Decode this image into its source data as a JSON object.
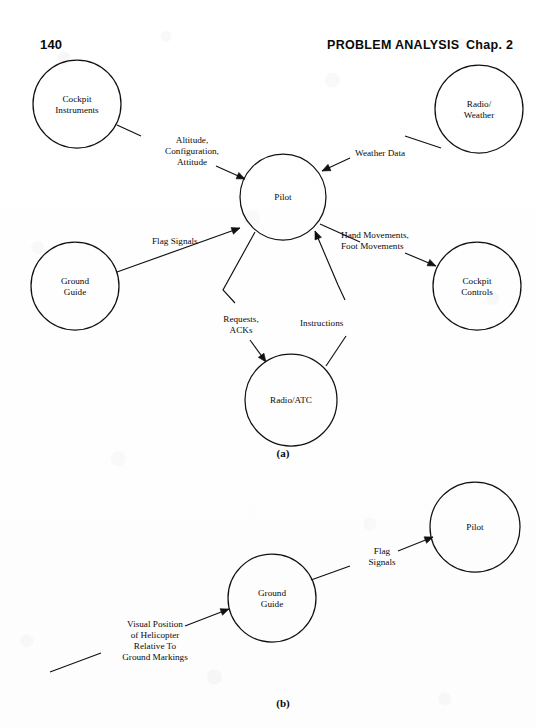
{
  "header": {
    "page_number": "140",
    "running_head": "PROBLEM ANALYSIS",
    "chapter_label": "Chap. 2"
  },
  "figures": [
    {
      "caption": "(a)",
      "x": 283,
      "y": 457
    },
    {
      "caption": "(b)",
      "x": 283,
      "y": 707
    }
  ],
  "diagram_a": {
    "nodes": [
      {
        "id": "cockpit-instruments",
        "label_lines": [
          "Cockpit",
          "Instruments"
        ],
        "cx": 77,
        "cy": 104,
        "r": 44
      },
      {
        "id": "radio-weather",
        "label_lines": [
          "Radio/",
          "Weather"
        ],
        "cx": 479,
        "cy": 109,
        "r": 44
      },
      {
        "id": "pilot",
        "label_lines": [
          "Pilot"
        ],
        "cx": 283,
        "cy": 197,
        "r": 43
      },
      {
        "id": "ground-guide",
        "label_lines": [
          "Ground",
          "Guide"
        ],
        "cx": 75,
        "cy": 286,
        "r": 44
      },
      {
        "id": "cockpit-controls",
        "label_lines": [
          "Cockpit",
          "Controls"
        ],
        "cx": 477,
        "cy": 286,
        "r": 44
      },
      {
        "id": "radio-atc",
        "label_lines": [
          "Radio/ATC"
        ],
        "cx": 291,
        "cy": 400,
        "r": 46
      }
    ],
    "edges": [
      {
        "id": "altitude-configuration-attitude",
        "from": "cockpit-instruments",
        "to": "pilot",
        "label_lines": [
          "Altitude,",
          "Configuration,",
          "Attitude"
        ],
        "label_x": 192,
        "label_y": 143,
        "label_anchor": "middle",
        "points": "117,125 141,136",
        "points2": "216,166 245,179",
        "arrow_at": "245,179",
        "arrow_angle": 24
      },
      {
        "id": "weather-data",
        "from": "radio-weather",
        "to": "pilot",
        "label_lines": [
          "Weather Data"
        ],
        "label_x": 355,
        "label_y": 156,
        "label_anchor": "start",
        "points": "441,148 405,136",
        "points2": "350,158 322,171",
        "arrow_at": "322,171",
        "arrow_angle": 155
      },
      {
        "id": "flag-signals-a",
        "from": "ground-guide",
        "to": "pilot",
        "label_lines": [
          "Flag Signals"
        ],
        "label_x": 152,
        "label_y": 244,
        "label_anchor": "start",
        "points": "117,272 240,228",
        "points2": "",
        "arrow_at": "240,228",
        "arrow_angle": -20
      },
      {
        "id": "hand-movements-foot-movements",
        "from": "pilot",
        "to": "cockpit-controls",
        "label_lines": [
          "Hand Movements,",
          "Foot Movements"
        ],
        "label_x": 341,
        "label_y": 238,
        "label_anchor": "start",
        "points": "320,224 360,242",
        "points2": "405,253 436,266",
        "arrow_at": "436,266",
        "arrow_angle": 24
      },
      {
        "id": "requests-acks",
        "from": "pilot",
        "to": "radio-atc",
        "label_lines": [
          "Requests,",
          "ACKs"
        ],
        "label_x": 241,
        "label_y": 322,
        "label_anchor": "middle",
        "points": "255,232 223,290 235,303",
        "points2": "250,340 266,362",
        "arrow_at": "266,362",
        "arrow_angle": 54
      },
      {
        "id": "instructions",
        "from": "radio-atc",
        "to": "pilot",
        "label_lines": [
          "Instructions"
        ],
        "label_x": 300,
        "label_y": 326,
        "label_anchor": "start",
        "points": "326,366 346,336",
        "points2": "345,300 338,285 315,231",
        "arrow_at": "315,231",
        "arrow_angle": -113
      }
    ]
  },
  "diagram_b": {
    "nodes": [
      {
        "id": "ground-guide-b",
        "label_lines": [
          "Ground",
          "Guide"
        ],
        "cx": 272,
        "cy": 598,
        "r": 44
      },
      {
        "id": "pilot-b",
        "label_lines": [
          "Pilot"
        ],
        "cx": 475,
        "cy": 527,
        "r": 45
      }
    ],
    "edges": [
      {
        "id": "flag-signals-b",
        "from": "ground-guide-b",
        "to": "pilot-b",
        "label_lines": [
          "Flag",
          "Signals"
        ],
        "label_x": 382,
        "label_y": 554,
        "label_anchor": "middle",
        "points": "311,580 350,566",
        "points2": "398,551 433,537",
        "arrow_at": "433,537",
        "arrow_angle": -22
      },
      {
        "id": "visual-position-input",
        "from": "",
        "to": "ground-guide-b",
        "label_lines": [
          "Visual Position",
          "of Helicopter",
          "Relative To",
          "Ground Markings"
        ],
        "label_x": 155,
        "label_y": 627,
        "label_anchor": "middle",
        "points": "50,672 101,653",
        "points2": "185,626 229,609",
        "arrow_at": "229,609",
        "arrow_angle": -21
      }
    ]
  }
}
